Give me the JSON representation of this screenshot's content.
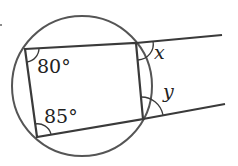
{
  "diagram": {
    "type": "cyclic-quadrilateral-with-exterior-lines",
    "labels": {
      "angle_top_left": "80°",
      "angle_bottom_left": "85°",
      "angle_x": "x",
      "angle_y": "y"
    },
    "colors": {
      "stroke": "#3a3a3a",
      "circle": "#555555",
      "text": "#222222"
    }
  }
}
